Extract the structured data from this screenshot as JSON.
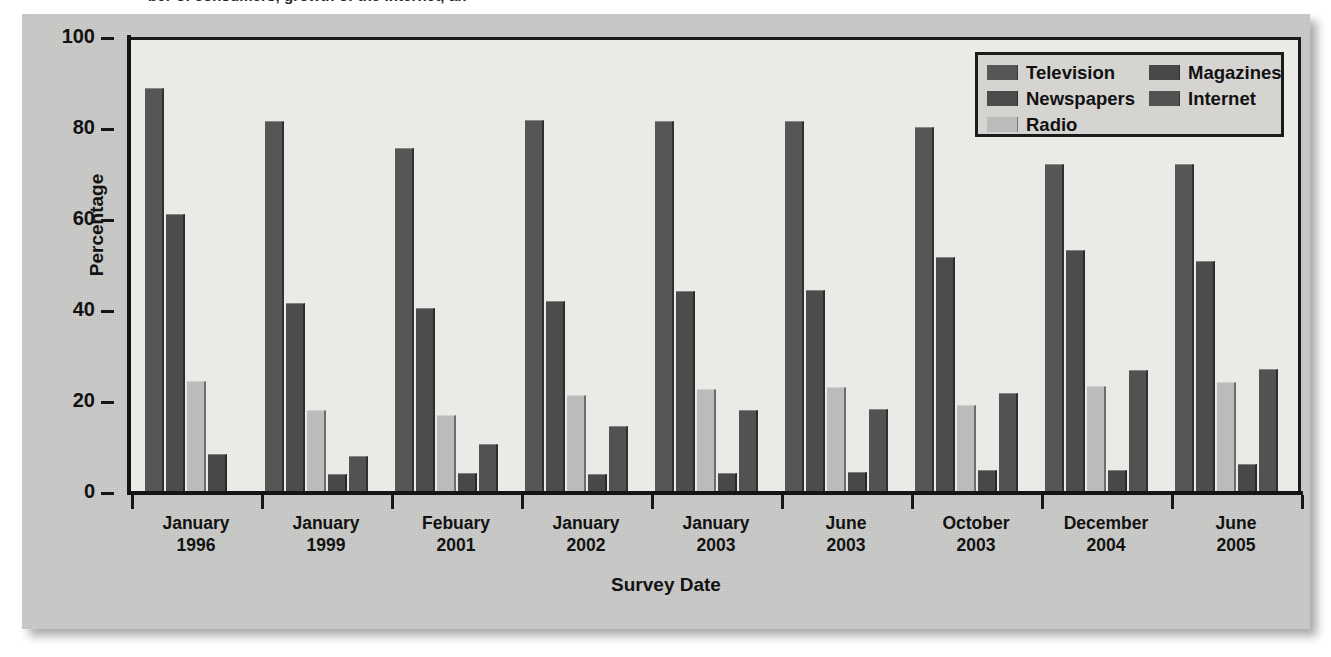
{
  "top_caption": "ber of consumers, growth of the Internet, an",
  "chart_data": {
    "type": "bar",
    "title": "",
    "xlabel": "Survey Date",
    "ylabel": "Percentage",
    "ylim": [
      0,
      100
    ],
    "yticks": [
      0,
      20,
      40,
      60,
      80,
      100
    ],
    "grid": false,
    "legend_position": "top-right",
    "categories": [
      "January\n1996",
      "January\n1999",
      "Febuary\n2001",
      "January\n2002",
      "January\n2003",
      "June\n2003",
      "October\n2003",
      "December\n2004",
      "June\n2005"
    ],
    "category_lines": [
      [
        "January",
        "1996"
      ],
      [
        "January",
        "1999"
      ],
      [
        "Febuary",
        "2001"
      ],
      [
        "January",
        "2002"
      ],
      [
        "January",
        "2003"
      ],
      [
        "June",
        "2003"
      ],
      [
        "October",
        "2003"
      ],
      [
        "December",
        "2004"
      ],
      [
        "June",
        "2005"
      ]
    ],
    "series": [
      {
        "name": "Television",
        "color": "#565656",
        "values": [
          88.8,
          81.5,
          75.6,
          81.8,
          81.5,
          81.6,
          80.3,
          72.0,
          72.1
        ]
      },
      {
        "name": "Newspapers",
        "color": "#4c4c4c",
        "values": [
          61.2,
          41.5,
          40.5,
          42.0,
          44.1,
          44.4,
          51.7,
          53.1,
          50.8
        ]
      },
      {
        "name": "Radio",
        "color": "#bbbbbb",
        "values": [
          24.5,
          18.0,
          17.0,
          21.4,
          22.7,
          23.0,
          19.1,
          23.4,
          24.2
        ]
      },
      {
        "name": "Magazines",
        "color": "#484848",
        "values": [
          8.4,
          4.0,
          4.2,
          3.9,
          4.2,
          4.4,
          4.8,
          4.9,
          6.2
        ]
      },
      {
        "name": "Internet",
        "color": "#525252",
        "values": [
          null,
          8.0,
          10.6,
          14.6,
          18.0,
          18.2,
          21.7,
          26.8,
          27.0
        ]
      }
    ],
    "legend": {
      "left_column": [
        "Television",
        "Newspapers",
        "Radio"
      ],
      "right_column": [
        "Magazines",
        "Internet"
      ]
    }
  }
}
